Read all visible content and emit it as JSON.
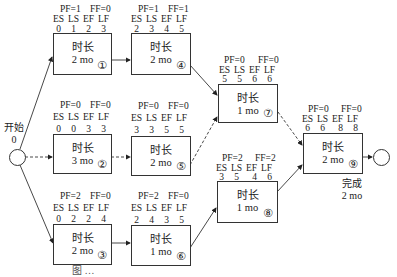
{
  "diagram": {
    "type": "activity-on-node network (critical path / float)",
    "start": {
      "label": "开始",
      "value": "0"
    },
    "finish": {
      "label": "完成",
      "value": "2 mo"
    },
    "field_headers": [
      "ES",
      "LS",
      "EF",
      "LF"
    ],
    "duration_label": "时长",
    "nodes": [
      {
        "id": "①",
        "pf": "PF=1",
        "ff": "FF=0",
        "es": "0",
        "ls": "1",
        "ef": "2",
        "lf": "3",
        "duration": "2 mo"
      },
      {
        "id": "②",
        "pf": "PF=0",
        "ff": "FF=0",
        "es": "0",
        "ls": "0",
        "ef": "3",
        "lf": "3",
        "duration": "3 mo"
      },
      {
        "id": "③",
        "pf": "PF=2",
        "ff": "FF=0",
        "es": "0",
        "ls": "2",
        "ef": "2",
        "lf": "4",
        "duration": "2 mo"
      },
      {
        "id": "④",
        "pf": "PF=1",
        "ff": "FF=1",
        "es": "2",
        "ls": "3",
        "ef": "4",
        "lf": "5",
        "duration": "2 mo"
      },
      {
        "id": "⑤",
        "pf": "PF=0",
        "ff": "FF=0",
        "es": "3",
        "ls": "3",
        "ef": "5",
        "lf": "5",
        "duration": "2 mo"
      },
      {
        "id": "⑥",
        "pf": "PF=2",
        "ff": "FF=0",
        "es": "2",
        "ls": "4",
        "ef": "3",
        "lf": "5",
        "duration": "1 mo"
      },
      {
        "id": "⑦",
        "pf": "PF=0",
        "ff": "FF=0",
        "es": "5",
        "ls": "5",
        "ef": "6",
        "lf": "6",
        "duration": "1 mo"
      },
      {
        "id": "⑧",
        "pf": "PF=2",
        "ff": "FF=2",
        "es": "3",
        "ls": "5",
        "ef": "4",
        "lf": "6",
        "duration": "1 mo"
      },
      {
        "id": "⑨",
        "pf": "PF=0",
        "ff": "FF=0",
        "es": "6",
        "ls": "6",
        "ef": "8",
        "lf": "8",
        "duration": "2 mo"
      }
    ],
    "edges": [
      {
        "from": "start",
        "to": "①",
        "style": "solid"
      },
      {
        "from": "start",
        "to": "②",
        "style": "dashed"
      },
      {
        "from": "start",
        "to": "③",
        "style": "solid"
      },
      {
        "from": "①",
        "to": "④",
        "style": "solid"
      },
      {
        "from": "②",
        "to": "⑤",
        "style": "dashed"
      },
      {
        "from": "③",
        "to": "⑥",
        "style": "solid"
      },
      {
        "from": "④",
        "to": "⑦",
        "style": "solid"
      },
      {
        "from": "⑤",
        "to": "⑦",
        "style": "dashed"
      },
      {
        "from": "⑥",
        "to": "⑧",
        "style": "solid"
      },
      {
        "from": "⑦",
        "to": "⑨",
        "style": "dashed"
      },
      {
        "from": "⑧",
        "to": "⑨",
        "style": "solid"
      },
      {
        "from": "⑨",
        "to": "finish",
        "style": "solid"
      }
    ],
    "caption": "图 …"
  }
}
